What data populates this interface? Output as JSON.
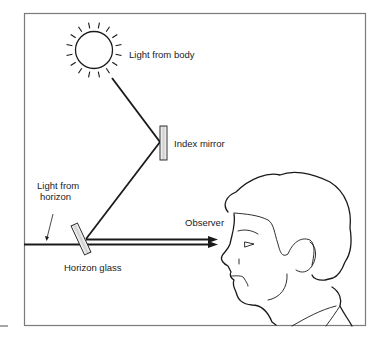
{
  "figure": {
    "labels": {
      "light_from_body": "Light from body",
      "index_mirror": "Index mirror",
      "light_from_horizon_line1": "Light from",
      "light_from_horizon_line2": "horizon",
      "observer": "Observer",
      "horizon_glass": "Horizon glass"
    },
    "colors": {
      "line": "#1a1a1a",
      "frame": "#777777",
      "mirror_fill": "#e2e2e2"
    }
  }
}
